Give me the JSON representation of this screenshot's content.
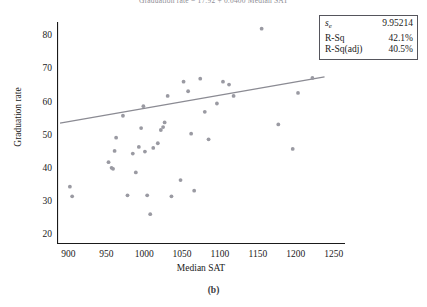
{
  "figure": {
    "title": "Graduation rate = 17.92 + 0.0400 Median SAT",
    "caption": "(b)"
  },
  "axes": {
    "xlabel": "Median SAT",
    "ylabel": "Graduation rate",
    "xticks": [
      900,
      950,
      1000,
      1050,
      1100,
      1150,
      1200,
      1250
    ],
    "yticks": [
      20,
      30,
      40,
      50,
      60,
      70,
      80
    ]
  },
  "stats": {
    "rows": [
      {
        "label_main": "s",
        "label_sub": "e",
        "value": "9.95214"
      },
      {
        "label_main": "R-Sq",
        "label_sub": "",
        "value": "42.1%"
      },
      {
        "label_main": "R-Sq(adj)",
        "label_sub": "",
        "value": "40.5%"
      }
    ]
  },
  "chart_data": {
    "type": "scatter",
    "title": "Graduation rate = 17.92 + 0.0400 Median SAT",
    "xlabel": "Median SAT",
    "ylabel": "Graduation rate",
    "xlim": [
      885,
      1265
    ],
    "ylim": [
      17,
      84
    ],
    "grid": false,
    "legend": null,
    "marker_color": "#9a9aa2",
    "line_color": "#8b8b93",
    "points": [
      {
        "x": 902,
        "y": 34.3
      },
      {
        "x": 905,
        "y": 31.4
      },
      {
        "x": 953,
        "y": 41.7
      },
      {
        "x": 957,
        "y": 40.0
      },
      {
        "x": 959,
        "y": 39.7
      },
      {
        "x": 961,
        "y": 45.1
      },
      {
        "x": 963,
        "y": 49.1
      },
      {
        "x": 972,
        "y": 55.7
      },
      {
        "x": 978,
        "y": 31.7
      },
      {
        "x": 985,
        "y": 44.3
      },
      {
        "x": 989,
        "y": 38.6
      },
      {
        "x": 993,
        "y": 46.3
      },
      {
        "x": 996,
        "y": 52.0
      },
      {
        "x": 999,
        "y": 58.6
      },
      {
        "x": 1001,
        "y": 44.9
      },
      {
        "x": 1004,
        "y": 31.7
      },
      {
        "x": 1008,
        "y": 26.0
      },
      {
        "x": 1012,
        "y": 46.0
      },
      {
        "x": 1018,
        "y": 47.4
      },
      {
        "x": 1022,
        "y": 51.4
      },
      {
        "x": 1025,
        "y": 52.3
      },
      {
        "x": 1027,
        "y": 53.7
      },
      {
        "x": 1031,
        "y": 61.7
      },
      {
        "x": 1036,
        "y": 31.4
      },
      {
        "x": 1048,
        "y": 36.3
      },
      {
        "x": 1052,
        "y": 66.0
      },
      {
        "x": 1058,
        "y": 63.1
      },
      {
        "x": 1062,
        "y": 50.3
      },
      {
        "x": 1066,
        "y": 33.1
      },
      {
        "x": 1074,
        "y": 66.9
      },
      {
        "x": 1080,
        "y": 56.9
      },
      {
        "x": 1085,
        "y": 48.6
      },
      {
        "x": 1096,
        "y": 59.4
      },
      {
        "x": 1104,
        "y": 66.0
      },
      {
        "x": 1112,
        "y": 65.1
      },
      {
        "x": 1118,
        "y": 61.7
      },
      {
        "x": 1155,
        "y": 82.0
      },
      {
        "x": 1177,
        "y": 53.1
      },
      {
        "x": 1196,
        "y": 45.7
      },
      {
        "x": 1203,
        "y": 62.6
      },
      {
        "x": 1222,
        "y": 67.1
      }
    ],
    "fit_line": {
      "label": "Graduation rate = 17.92 + 0.0400 Median SAT",
      "intercept": 17.92,
      "slope": 0.04,
      "x_start": 889,
      "x_end": 1238
    }
  }
}
